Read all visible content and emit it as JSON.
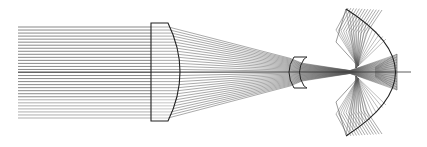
{
  "diagram": {
    "type": "optical-ray-trace",
    "width": 427,
    "height": 147,
    "background": "#ffffff",
    "colors": {
      "ray": "#555555",
      "ray_light": "#8a8a8a",
      "element": "#222222",
      "axis": "#333333"
    },
    "optical_axis": {
      "y": 72,
      "x_start": 18,
      "x_end": 411
    },
    "source": {
      "kind": "collimated-beam",
      "x_start": 18,
      "x_end": 151,
      "y_top": 27,
      "y_bottom": 118,
      "ray_count": 31
    },
    "elements": [
      {
        "id": "plano-convex-lens",
        "kind": "lens",
        "flat_face_x": 151,
        "edge_x": 168,
        "apex_x": 180,
        "y_top": 23,
        "y_bottom": 121
      },
      {
        "id": "negative-meniscus-lens",
        "kind": "lens",
        "front_x": 290,
        "back_x": 302,
        "flange_x_end": 307,
        "y_top": 57,
        "y_bottom": 88
      },
      {
        "id": "concave-mirror",
        "kind": "mirror",
        "vertex_x": 411,
        "tip_x": 346,
        "y_top": 9,
        "y_bottom": 136
      }
    ],
    "focus": {
      "x": 350,
      "y": 72
    },
    "reflected_fans": [
      {
        "id": "upper-fan",
        "apex_x": 358,
        "apex_y": 66,
        "spread_top_y": 10,
        "target_x": 336,
        "target_y_top": 30
      },
      {
        "id": "lower-fan",
        "apex_x": 358,
        "apex_y": 78,
        "spread_bottom_y": 137,
        "target_x": 336,
        "target_y_bottom": 114
      }
    ],
    "inner_fan": {
      "x_start": 350,
      "x_end": 397,
      "y_top": 54,
      "y_bottom": 90
    }
  }
}
